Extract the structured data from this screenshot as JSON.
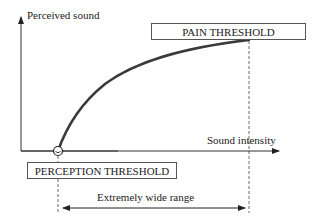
{
  "diagram": {
    "y_axis": {
      "label": "Perceived sound"
    },
    "x_axis": {
      "label": "Sound intensity"
    },
    "pain_threshold": {
      "label": "PAIN THRESHOLD"
    },
    "perception_threshold": {
      "label": "PERCEPTION THRESHOLD"
    },
    "range": {
      "label": "Extremely wide range"
    },
    "curve": {
      "description": "Concave (logarithmic-like) curve from perception threshold to pain threshold",
      "color": "#3a3a3a"
    },
    "colors": {
      "axis": "#333333",
      "curve": "#3a3a3a",
      "box_border": "#555555",
      "text": "#222222"
    }
  }
}
